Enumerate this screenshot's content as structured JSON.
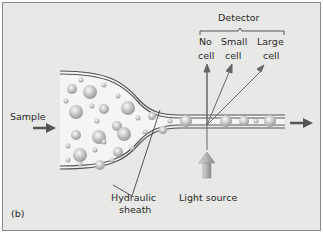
{
  "figure": {
    "panel_label": "(b)",
    "labels": {
      "detector": "Detector",
      "no_cell_1": "No",
      "no_cell_2": "cell",
      "small_cell_1": "Small",
      "small_cell_2": "cell",
      "large_cell_1": "Large",
      "large_cell_2": "cell",
      "sample": "Sample",
      "hydraulic_1": "Hydraulic",
      "hydraulic_2": "sheath",
      "light_source": "Light source"
    },
    "colors": {
      "background": "#e8e8e6",
      "channel_fill": "#f4f4f2",
      "tube_wall": "#555555",
      "arrow": "#555555",
      "cell": "#b5b5b5"
    }
  }
}
